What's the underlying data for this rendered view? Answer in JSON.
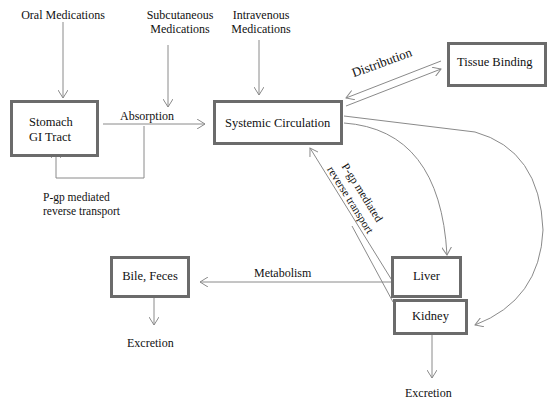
{
  "diagram": {
    "sources": {
      "oral": "Oral Medications",
      "subcutaneous_line1": "Subcutaneous",
      "subcutaneous_line2": "Medications",
      "intravenous_line1": "Intravenous",
      "intravenous_line2": "Medications"
    },
    "nodes": {
      "stomach_line1": "Stomach",
      "stomach_line2": "GI Tract",
      "systemic": "Systemic Circulation",
      "tissue": "Tissue Binding",
      "liver": "Liver",
      "kidney": "Kidney",
      "bile": "Bile, Feces"
    },
    "edge_labels": {
      "absorption": "Absorption",
      "distribution": "Distribution",
      "pgp_gi_line1": "P-gp mediated",
      "pgp_gi_line2": "reverse transport",
      "pgp_liver_line1": "P-gp mediated",
      "pgp_liver_line2": "reverse transport",
      "metabolism": "Metabolism",
      "excretion_bile": "Excretion",
      "excretion_kidney": "Excretion"
    },
    "colors": {
      "box_border": "#6b6b6b",
      "arrow": "#8a8a8a"
    }
  }
}
